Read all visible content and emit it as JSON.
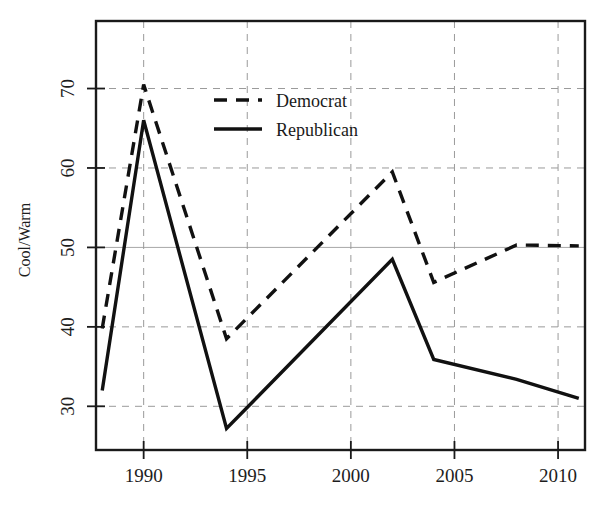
{
  "chart_data": {
    "type": "line",
    "title": "",
    "xlabel": "",
    "ylabel": "Cool/Warm",
    "xlim": [
      1987.7,
      2011.3
    ],
    "ylim": [
      24.5,
      78.5
    ],
    "xticks": [
      1990,
      1995,
      2000,
      2005,
      2010
    ],
    "xtick_labels": [
      "1990",
      "1995",
      "2000",
      "2005",
      "2010"
    ],
    "yticks": [
      30,
      40,
      50,
      60,
      70
    ],
    "ytick_labels": [
      "30",
      "40",
      "50",
      "60",
      "70"
    ],
    "grid": true,
    "legend_position": "upper center",
    "series": [
      {
        "name": "Democrat",
        "style": "dashed",
        "x": [
          1988,
          1990,
          1994,
          2002,
          2004,
          2008,
          2011
        ],
        "values": [
          39.8,
          70.5,
          38.5,
          59.5,
          45.6,
          50.3,
          50.2
        ]
      },
      {
        "name": "Republican",
        "style": "solid",
        "x": [
          1988,
          1990,
          1994,
          2002,
          2004,
          2008,
          2011
        ],
        "values": [
          32.0,
          66.0,
          27.2,
          48.5,
          35.9,
          33.4,
          31.0
        ]
      }
    ]
  },
  "legend": {
    "items": [
      {
        "label": "Democrat",
        "style": "dashed"
      },
      {
        "label": "Republican",
        "style": "solid"
      }
    ]
  },
  "colors": {
    "line": "#111111",
    "grid": "#9a9a9a",
    "frame": "#1a1a1a",
    "background": "#ffffff"
  }
}
